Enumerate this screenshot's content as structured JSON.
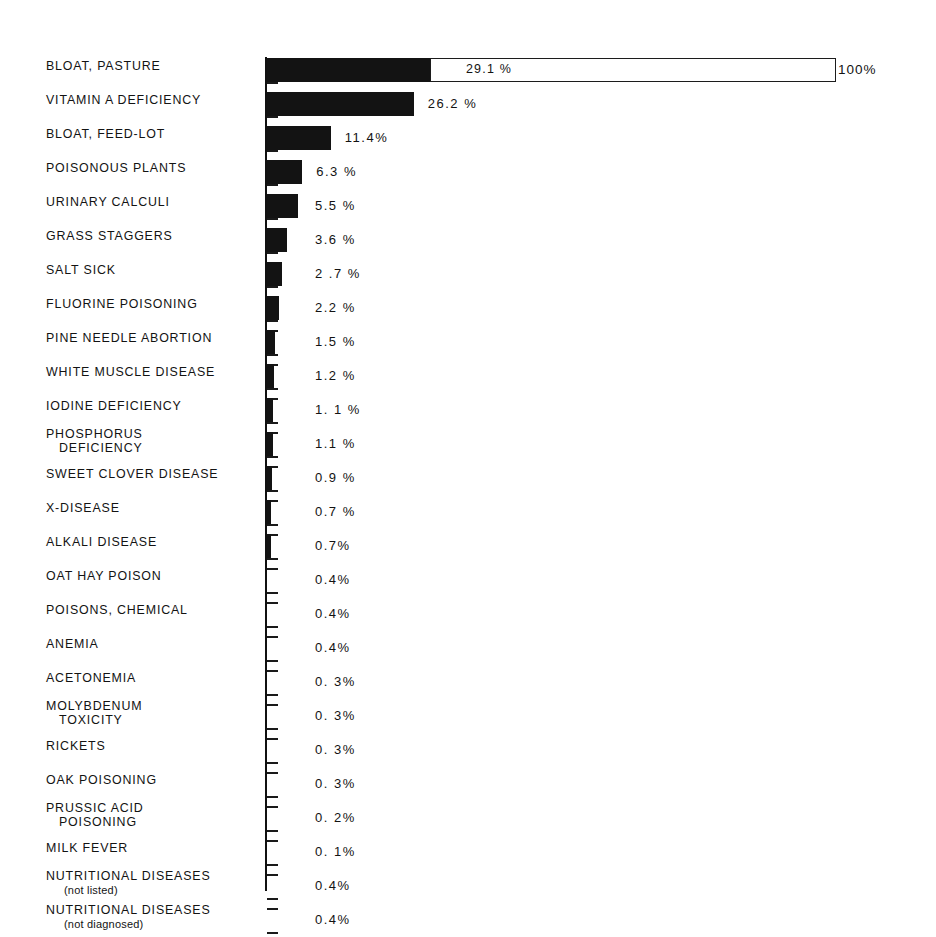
{
  "chart_data": {
    "type": "bar",
    "orientation": "horizontal",
    "title": "",
    "subtitle": "",
    "xlabel": "",
    "ylabel": "",
    "xlim": [
      0,
      100
    ],
    "grid": false,
    "legend": "none",
    "reference_label": "100%",
    "reference_value": 100,
    "value_suffix": "%",
    "categories": [
      "BLOAT, PASTURE",
      "VITAMIN A DEFICIENCY",
      "BLOAT, FEED-LOT",
      "POISONOUS PLANTS",
      "URINARY CALCULI",
      "GRASS STAGGERS",
      "SALT SICK",
      "FLUORINE POISONING",
      "PINE NEEDLE ABORTION",
      "WHITE MUSCLE DISEASE",
      "IODINE DEFICIENCY",
      "PHOSPHORUS DEFICIENCY",
      "SWEET CLOVER DISEASE",
      "X-DISEASE",
      "ALKALI DISEASE",
      "OAT HAY POISON",
      "POISONS, CHEMICAL",
      "ANEMIA",
      "ACETONEMIA",
      "MOLYBDENUM TOXICITY",
      "RICKETS",
      "OAK POISONING",
      "PRUSSIC ACID POISONING",
      "MILK FEVER",
      "NUTRITIONAL DISEASES (not listed)",
      "NUTRITIONAL DISEASES (not diagnosed)"
    ],
    "values": [
      29.1,
      26.2,
      11.4,
      6.3,
      5.5,
      3.6,
      2.7,
      2.2,
      1.5,
      1.2,
      1.1,
      1.1,
      0.9,
      0.7,
      0.7,
      0.4,
      0.4,
      0.4,
      0.3,
      0.3,
      0.3,
      0.3,
      0.2,
      0.1,
      0.4,
      0.4
    ]
  },
  "rows": [
    {
      "label_line1": "BLOAT, PASTURE",
      "label_line2": "",
      "sub": "",
      "value_text": "29.1 %",
      "value": 29.1
    },
    {
      "label_line1": "VITAMIN A DEFICIENCY",
      "label_line2": "",
      "sub": "",
      "value_text": "26.2 %",
      "value": 26.2
    },
    {
      "label_line1": "BLOAT, FEED-LOT",
      "label_line2": "",
      "sub": "",
      "value_text": "11.4%",
      "value": 11.4
    },
    {
      "label_line1": "POISONOUS PLANTS",
      "label_line2": "",
      "sub": "",
      "value_text": "6.3 %",
      "value": 6.3
    },
    {
      "label_line1": "URINARY CALCULI",
      "label_line2": "",
      "sub": "",
      "value_text": "5.5 %",
      "value": 5.5
    },
    {
      "label_line1": "GRASS STAGGERS",
      "label_line2": "",
      "sub": "",
      "value_text": "3.6 %",
      "value": 3.6
    },
    {
      "label_line1": "SALT SICK",
      "label_line2": "",
      "sub": "",
      "value_text": "2 .7 %",
      "value": 2.7
    },
    {
      "label_line1": "FLUORINE POISONING",
      "label_line2": "",
      "sub": "",
      "value_text": "2.2 %",
      "value": 2.2
    },
    {
      "label_line1": "PINE NEEDLE ABORTION",
      "label_line2": "",
      "sub": "",
      "value_text": "1.5 %",
      "value": 1.5
    },
    {
      "label_line1": "WHITE MUSCLE DISEASE",
      "label_line2": "",
      "sub": "",
      "value_text": "1.2 %",
      "value": 1.2
    },
    {
      "label_line1": "IODINE DEFICIENCY",
      "label_line2": "",
      "sub": "",
      "value_text": "1. 1 %",
      "value": 1.1
    },
    {
      "label_line1": "PHOSPHORUS",
      "label_line2": "DEFICIENCY",
      "sub": "",
      "value_text": "1.1 %",
      "value": 1.1
    },
    {
      "label_line1": "SWEET CLOVER DISEASE",
      "label_line2": "",
      "sub": "",
      "value_text": "0.9 %",
      "value": 0.9
    },
    {
      "label_line1": "X-DISEASE",
      "label_line2": "",
      "sub": "",
      "value_text": "0.7 %",
      "value": 0.7
    },
    {
      "label_line1": "ALKALI DISEASE",
      "label_line2": "",
      "sub": "",
      "value_text": "0.7%",
      "value": 0.7
    },
    {
      "label_line1": "OAT HAY POISON",
      "label_line2": "",
      "sub": "",
      "value_text": "0.4%",
      "value": 0.4
    },
    {
      "label_line1": "POISONS, CHEMICAL",
      "label_line2": "",
      "sub": "",
      "value_text": "0.4%",
      "value": 0.4
    },
    {
      "label_line1": "ANEMIA",
      "label_line2": "",
      "sub": "",
      "value_text": "0.4%",
      "value": 0.4
    },
    {
      "label_line1": "ACETONEMIA",
      "label_line2": "",
      "sub": "",
      "value_text": "0. 3%",
      "value": 0.3
    },
    {
      "label_line1": "MOLYBDENUM",
      "label_line2": "TOXICITY",
      "sub": "",
      "value_text": "0. 3%",
      "value": 0.3
    },
    {
      "label_line1": "RICKETS",
      "label_line2": "",
      "sub": "",
      "value_text": "0. 3%",
      "value": 0.3
    },
    {
      "label_line1": "OAK POISONING",
      "label_line2": "",
      "sub": "",
      "value_text": "0. 3%",
      "value": 0.3
    },
    {
      "label_line1": "PRUSSIC ACID",
      "label_line2": "POISONING",
      "sub": "",
      "value_text": "0. 2%",
      "value": 0.2
    },
    {
      "label_line1": "MILK FEVER",
      "label_line2": "",
      "sub": "",
      "value_text": "0. 1%",
      "value": 0.1
    },
    {
      "label_line1": "NUTRITIONAL DISEASES",
      "label_line2": "",
      "sub": "(not listed)",
      "value_text": "0.4%",
      "value": 0.4
    },
    {
      "label_line1": "NUTRITIONAL DISEASES",
      "label_line2": "",
      "sub": "(not diagnosed)",
      "value_text": "0.4%",
      "value": 0.4
    }
  ],
  "reference": {
    "label": "100%",
    "inline_value": "29.1 %"
  },
  "colors": {
    "bar": "#131313",
    "background": "#ffffff",
    "text": "#131313",
    "axis": "#111111"
  }
}
